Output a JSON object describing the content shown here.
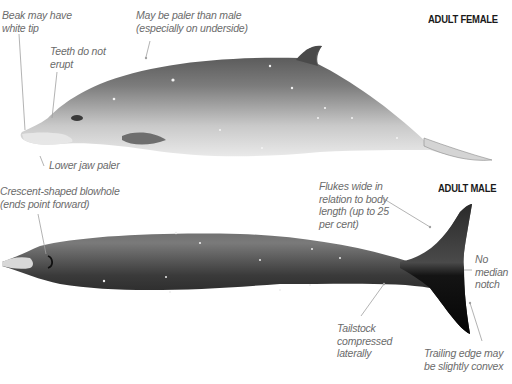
{
  "figure": {
    "panels": [
      {
        "id": "female",
        "heading": "ADULT FEMALE",
        "annotations": [
          {
            "id": "beak_tip",
            "text": "Beak may have\nwhite tip"
          },
          {
            "id": "teeth",
            "text": "Teeth do not\nerupt"
          },
          {
            "id": "paler",
            "text": "May be paler than male\n(especially on underside)"
          },
          {
            "id": "lower_jaw",
            "text": "Lower jaw paler"
          }
        ]
      },
      {
        "id": "male",
        "heading": "ADULT MALE",
        "annotations": [
          {
            "id": "blowhole",
            "text": "Crescent-shaped blowhole\n(ends point forward)"
          },
          {
            "id": "flukes",
            "text": "Flukes wide in\nrelation to body\nlength (up to 25\nper cent)"
          },
          {
            "id": "notch",
            "text": "No\nmedian\nnotch"
          },
          {
            "id": "tailstock",
            "text": "Tailstock\ncompressed\nlaterally"
          },
          {
            "id": "trailing_edge",
            "text": "Trailing edge may\nbe slightly convex"
          }
        ]
      }
    ],
    "colors": {
      "background": "#ffffff",
      "female_body_dark": "#5e5e5e",
      "female_body_light": "#e6e6e6",
      "male_body_dark": "#151515",
      "male_body_mid": "#6a6a6a",
      "annotation_text": "#6b6b6b",
      "leader_line": "#a0a0a0",
      "heading_text": "#1a1a1a"
    }
  }
}
